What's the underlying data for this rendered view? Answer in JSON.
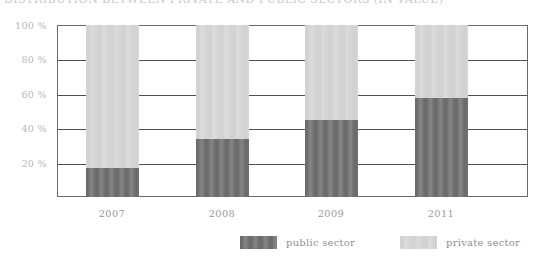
{
  "chart_data": {
    "type": "bar",
    "subtype": "stacked-100-percent",
    "title": "DISTRIBUTION BETWEEN PRIVATE AND PUBLIC SECTORS (IN VALUE)",
    "xlabel": "",
    "ylabel": "",
    "categories": [
      "2007",
      "2008",
      "2009",
      "2011"
    ],
    "series": [
      {
        "name": "public sector",
        "color": "#6e6e6e",
        "values": [
          17,
          34,
          45,
          57.5
        ]
      },
      {
        "name": "private sector",
        "color": "#d4d4d4",
        "values": [
          83,
          66,
          55,
          42.5
        ]
      }
    ],
    "ylim": [
      0,
      100
    ],
    "yticks": [
      20,
      40,
      60,
      80,
      100
    ],
    "ytick_labels": [
      "20 %",
      "40 %",
      "60 %",
      "80 %",
      "100 %"
    ],
    "grid": true,
    "legend_position": "bottom"
  },
  "legend": {
    "items": [
      {
        "label": "public sector",
        "color": "#6e6e6e"
      },
      {
        "label": "private sector",
        "color": "#d4d4d4"
      }
    ]
  }
}
